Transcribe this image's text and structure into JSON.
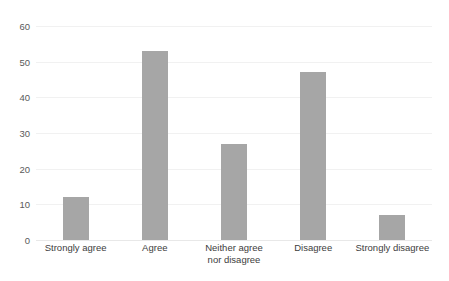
{
  "title": {
    "text": "clipped-title",
    "visible_fragment": ""
  },
  "axis": {
    "y_ticks": [
      "0",
      "10",
      "20",
      "30",
      "40",
      "50",
      "60"
    ],
    "y_min": 0,
    "y_max": 60,
    "y_label": "",
    "x_label": ""
  },
  "colors": {
    "bar_fill": "#a6a6a6",
    "gridline": "#f1f1f1",
    "baseline": "#e8e8e8",
    "tick_text": "#5a5a5a",
    "label_text": "#3d3d3d",
    "background": "#ffffff"
  },
  "chart_data": {
    "type": "bar",
    "title": "",
    "xlabel": "",
    "ylabel": "",
    "ylim": [
      0,
      60
    ],
    "ytick_step": 10,
    "grid": true,
    "legend": false,
    "orientation": "vertical",
    "categories": [
      "Strongly agree",
      "Agree",
      "Neither agree nor disagree",
      "Disagree",
      "Strongly disagree"
    ],
    "category_lines": [
      [
        "Strongly agree"
      ],
      [
        "Agree"
      ],
      [
        "Neither agree",
        "nor disagree"
      ],
      [
        "Disagree"
      ],
      [
        "Strongly disagree"
      ]
    ],
    "values": [
      12,
      53,
      27,
      47,
      7
    ],
    "series": [
      {
        "name": "Responses",
        "values": [
          12,
          53,
          27,
          47,
          7
        ]
      }
    ]
  }
}
